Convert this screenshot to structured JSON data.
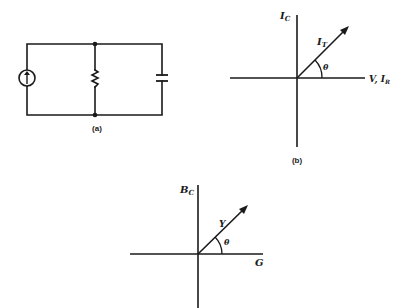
{
  "figure": {
    "panel_a": {
      "caption": "(a)",
      "components": [
        "current-source",
        "resistor",
        "capacitor"
      ],
      "topology": "parallel"
    },
    "panel_b": {
      "caption": "(b)",
      "vertical_axis_label": "I",
      "vertical_axis_sub": "C",
      "horizontal_axis_label": "V, I",
      "horizontal_axis_sub": "R",
      "vector_label": "I",
      "vector_sub": "T",
      "angle_label": "θ"
    },
    "panel_c": {
      "vertical_axis_label": "B",
      "vertical_axis_sub": "C",
      "horizontal_axis_label": "G",
      "vector_label": "Y",
      "angle_label": "θ"
    }
  },
  "colors": {
    "ink": "#1a1a1a",
    "background": "#ffffff"
  }
}
